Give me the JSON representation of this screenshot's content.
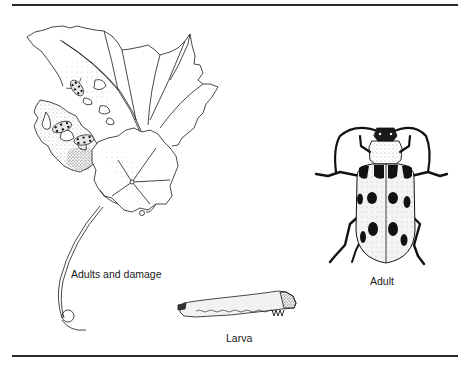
{
  "figure": {
    "panels": [
      {
        "id": "damage",
        "label": "Adults and damage",
        "subject": "leaf-with-feeding-damage-and-adult-beetles"
      },
      {
        "id": "adult",
        "label": "Adult",
        "subject": "spotted-beetle-dorsal-view"
      },
      {
        "id": "larva",
        "label": "Larva",
        "subject": "larva-lateral-view"
      }
    ],
    "colors": {
      "ink": "#1a1a1a",
      "rule": "#2a2a2a",
      "background": "#ffffff",
      "stipple": "#9a9a9a"
    }
  }
}
